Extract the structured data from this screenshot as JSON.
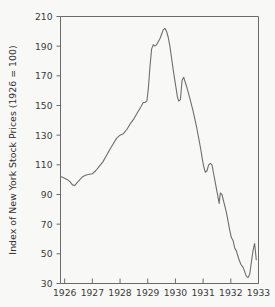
{
  "chart_data": {
    "type": "line",
    "title": "",
    "subtitle": "",
    "xlabel": "",
    "ylabel": "Index of New York Stock Prices (1926 = 100)",
    "xlim": [
      1925.85,
      1933.0
    ],
    "ylim": [
      30,
      210
    ],
    "grid": false,
    "legend": null,
    "legend_position": "none",
    "y_ticks": [
      30,
      50,
      70,
      90,
      110,
      130,
      150,
      170,
      190,
      210
    ],
    "x_ticks": [
      1926,
      1927,
      1928,
      1929,
      1930,
      1931,
      1932,
      1933
    ],
    "y_tick_labels": [
      "30",
      "50",
      "70",
      "90",
      "110",
      "130",
      "150",
      "170",
      "190",
      "210"
    ],
    "x_tick_labels": [
      "1926",
      "1927",
      "1928",
      "1929",
      "1930",
      "1931",
      "1932",
      "1933"
    ],
    "line_color": "#6e6e6e",
    "background_color": "#f8f8f6",
    "axis_color": "#6b6b6b",
    "series": [
      {
        "name": "Index of New York Stock Prices",
        "x": [
          1925.88,
          1926.0,
          1926.1,
          1926.2,
          1926.28,
          1926.36,
          1926.45,
          1926.55,
          1926.65,
          1926.75,
          1926.85,
          1927.0,
          1927.12,
          1927.25,
          1927.38,
          1927.5,
          1927.62,
          1927.75,
          1927.88,
          1928.0,
          1928.12,
          1928.25,
          1928.38,
          1928.5,
          1928.62,
          1928.75,
          1928.84,
          1928.9,
          1928.93,
          1928.97,
          1929.02,
          1929.08,
          1929.14,
          1929.2,
          1929.26,
          1929.32,
          1929.38,
          1929.44,
          1929.5,
          1929.56,
          1929.62,
          1929.68,
          1929.74,
          1929.8,
          1929.86,
          1929.92,
          1929.97,
          1930.02,
          1930.07,
          1930.12,
          1930.18,
          1930.24,
          1930.3,
          1930.4,
          1930.52,
          1930.64,
          1930.76,
          1930.86,
          1930.92,
          1930.97,
          1931.02,
          1931.08,
          1931.14,
          1931.2,
          1931.26,
          1931.32,
          1931.38,
          1931.44,
          1931.5,
          1931.54,
          1931.58,
          1931.62,
          1931.68,
          1931.76,
          1931.84,
          1931.9,
          1931.96,
          1932.02,
          1932.08,
          1932.14,
          1932.2,
          1932.28,
          1932.36,
          1932.44,
          1932.5,
          1932.56,
          1932.62,
          1932.68,
          1932.74,
          1932.8,
          1932.86,
          1932.92
        ],
        "values": [
          102,
          101,
          100,
          98.5,
          96.5,
          96,
          98,
          100,
          102,
          103,
          103.5,
          104,
          106,
          109,
          112,
          116,
          120,
          124,
          128,
          130,
          131,
          134,
          138,
          141,
          145,
          149,
          152,
          152,
          152.5,
          153,
          161,
          176,
          188,
          191,
          190,
          191,
          193,
          195,
          198,
          201,
          202,
          200,
          196,
          190,
          182,
          174,
          168,
          162,
          156,
          153,
          154,
          167,
          169,
          163,
          155,
          146,
          136,
          126,
          120,
          114,
          109,
          105,
          106,
          110,
          111,
          110,
          104,
          98,
          92,
          88,
          84,
          91,
          90,
          84,
          78,
          72,
          66,
          61,
          59,
          54,
          52,
          47,
          43,
          41,
          38,
          35,
          34,
          36,
          44,
          52,
          57,
          46
        ]
      }
    ],
    "annotations": [],
    "peak": {
      "year": "1929",
      "value": 202
    },
    "trough": {
      "year": "1932",
      "value": 34
    }
  },
  "axes": {
    "y_title": "Index of New York Stock Prices (1926 = 100)",
    "x_title": ""
  }
}
